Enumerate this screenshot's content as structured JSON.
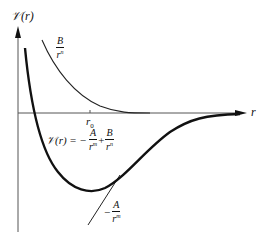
{
  "diagram": {
    "y_axis_label": "𝒱(r)",
    "x_axis_label": "r",
    "r0_label": "r",
    "r0_subscript": "0",
    "repulsive_term": {
      "numerator": "B",
      "denominator": "r",
      "exponent": "n"
    },
    "attractive_term": {
      "sign": "−",
      "numerator": "A",
      "denominator": "r",
      "exponent": "m"
    },
    "total_equation": {
      "lhs": "𝒱(r) = −",
      "term1": {
        "numerator": "A",
        "denominator": "r",
        "exponent": "m"
      },
      "plus": "+",
      "term2": {
        "numerator": "B",
        "denominator": "r",
        "exponent": "n"
      }
    },
    "colors": {
      "curve": "#111111",
      "axis": "#555555",
      "background": "#ffffff"
    }
  }
}
